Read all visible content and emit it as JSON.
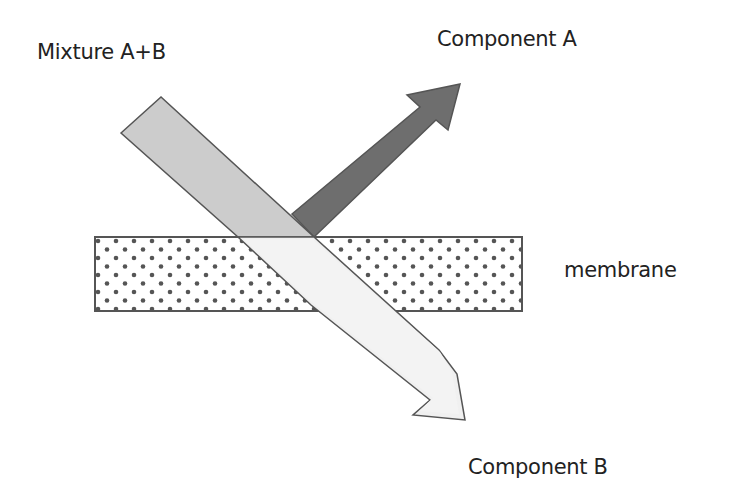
{
  "labels": {
    "mixture": "Mixture A+B",
    "component_a": "Component A",
    "component_b": "Component B",
    "membrane": "membrane"
  },
  "colors": {
    "background": "#ffffff",
    "mixture_fill": "#cccccc",
    "component_a_fill": "#6e6e6e",
    "component_b_fill": "#f0f0f0",
    "membrane_fill": "#ffffff",
    "membrane_dots": "#555555",
    "stroke": "#555555",
    "text": "#222222"
  }
}
